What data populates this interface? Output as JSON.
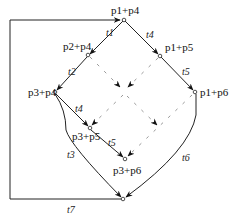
{
  "diagram": {
    "type": "reachability-graph",
    "states": [
      {
        "id": "s1",
        "label": "p1+p4"
      },
      {
        "id": "s2",
        "label": "p2+p4"
      },
      {
        "id": "s3",
        "label": "p1+p5"
      },
      {
        "id": "s4",
        "label": "p3+p4"
      },
      {
        "id": "s5",
        "label": "p1+p6"
      },
      {
        "id": "s6",
        "label": "p3+p5"
      },
      {
        "id": "s7",
        "label": "p3+p6"
      }
    ],
    "transitions": [
      {
        "label": "t1",
        "from": "p1+p4",
        "to": "p2+p4"
      },
      {
        "label": "t4",
        "from": "p1+p4",
        "to": "p1+p5"
      },
      {
        "label": "t2",
        "from": "p2+p4",
        "to": "p3+p4"
      },
      {
        "label": "t5",
        "from": "p1+p5",
        "to": "p1+p6"
      },
      {
        "label": "t4",
        "from": "p3+p4",
        "to": "p3+p5"
      },
      {
        "label": "t5",
        "from": "p3+p5",
        "to": "p3+p6"
      },
      {
        "label": "t3",
        "from": "p3+p4",
        "to": "final"
      },
      {
        "label": "t6",
        "from": "p1+p6",
        "to": "final"
      },
      {
        "label": "t7",
        "from": "final",
        "to": "p1+p4"
      }
    ],
    "transition_labels": {
      "t1": "t1",
      "t2": "t2",
      "t3": "t3",
      "t4a": "t4",
      "t4b": "t4",
      "t5a": "t5",
      "t5b": "t5",
      "t6": "t6",
      "t7": "t7"
    }
  }
}
